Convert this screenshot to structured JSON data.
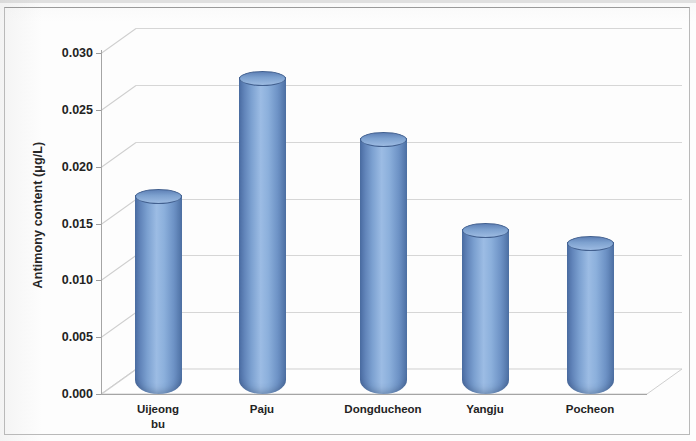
{
  "figure": {
    "background_color": "#fdfdfd",
    "frame_color": "#b9b9b9"
  },
  "chart_data": {
    "type": "bar",
    "title": "",
    "subtitle": "",
    "xlabel": "",
    "ylabel": "Antimony content (μg/L)",
    "categories": [
      "Uijeong\nbu",
      "Paju",
      "Dongducheon",
      "Yangju",
      "Pocheon"
    ],
    "values": [
      0.0174,
      0.0278,
      0.0224,
      0.0144,
      0.0133
    ],
    "ylim": [
      0.0,
      0.03
    ],
    "ytick_labels": [
      "0.030",
      "0.025",
      "0.020",
      "0.015",
      "0.010",
      "0.005",
      "0.000"
    ],
    "ytick_values": [
      0.03,
      0.025,
      0.02,
      0.015,
      0.01,
      0.005,
      0.0
    ],
    "grid": true,
    "legend": null,
    "series": [
      {
        "name": "Antimony content",
        "values": [
          0.0174,
          0.0278,
          0.0224,
          0.0144,
          0.0133
        ],
        "color": "#7ba0d0",
        "style": "3d-cylinder"
      }
    ],
    "bar_style": "3d-cylinder",
    "bar_color_light": "#9cbce4",
    "bar_color_dark": "#4c6ea4"
  }
}
